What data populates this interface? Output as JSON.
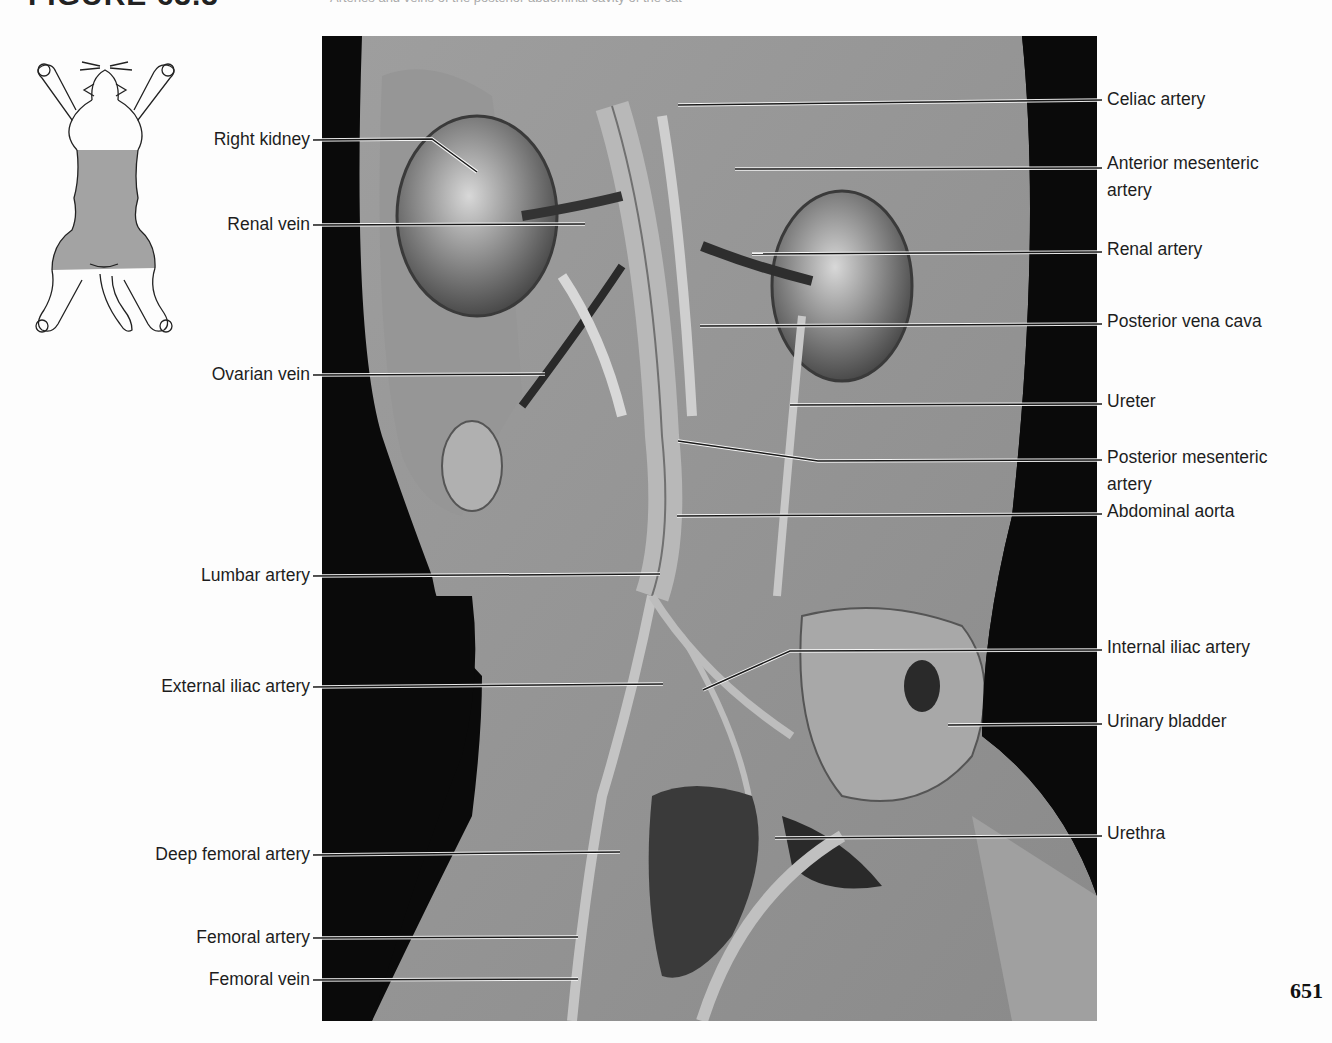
{
  "header": {
    "figure_title": "FIGURE 63.3",
    "caption_fragment": "Arteries and veins of the posterior abdominal cavity of the cat"
  },
  "orientation_icon": {
    "name": "cat-ventral-view-icon",
    "highlight_region": "abdomen",
    "highlight_color": "#9a9a9a"
  },
  "photo": {
    "description": "Dissected cat abdomen, ventral view, black background",
    "background": "#0a0a0a"
  },
  "labels_left": [
    {
      "id": "right-kidney",
      "text": "Right kidney",
      "y": 140
    },
    {
      "id": "renal-vein",
      "text": "Renal vein",
      "y": 225
    },
    {
      "id": "ovarian-vein",
      "text": "Ovarian vein",
      "y": 375
    },
    {
      "id": "lumbar-artery",
      "text": "Lumbar artery",
      "y": 576
    },
    {
      "id": "external-iliac-artery",
      "text": "External iliac artery",
      "y": 687
    },
    {
      "id": "deep-femoral-artery",
      "text": "Deep femoral artery",
      "y": 855
    },
    {
      "id": "femoral-artery",
      "text": "Femoral artery",
      "y": 938
    },
    {
      "id": "femoral-vein",
      "text": "Femoral vein",
      "y": 980
    }
  ],
  "labels_right": [
    {
      "id": "celiac-artery",
      "text": "Celiac artery",
      "y": 100
    },
    {
      "id": "anterior-mesenteric-artery",
      "text": "Anterior mesenteric",
      "text2": "artery",
      "y": 163
    },
    {
      "id": "renal-artery",
      "text": "Renal artery",
      "y": 250
    },
    {
      "id": "posterior-vena-cava",
      "text": "Posterior vena cava",
      "y": 322
    },
    {
      "id": "ureter",
      "text": "Ureter",
      "y": 402
    },
    {
      "id": "posterior-mesenteric-artery",
      "text": "Posterior mesenteric",
      "text2": "artery",
      "y": 457
    },
    {
      "id": "abdominal-aorta",
      "text": "Abdominal aorta",
      "y": 512
    },
    {
      "id": "internal-iliac-artery",
      "text": "Internal iliac artery",
      "y": 648
    },
    {
      "id": "urinary-bladder",
      "text": "Urinary bladder",
      "y": 722
    },
    {
      "id": "urethra",
      "text": "Urethra",
      "y": 834
    }
  ],
  "page_number": "651"
}
